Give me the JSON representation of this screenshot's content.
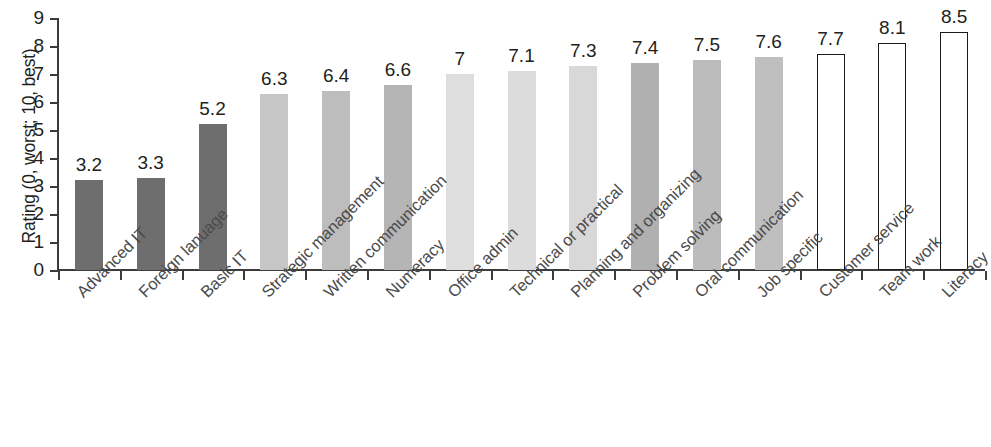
{
  "chart_data": {
    "type": "bar",
    "title": "",
    "subtitle": "",
    "xlabel": "",
    "ylabel": "Rating (0, worst; 10, best)",
    "ylim": [
      0,
      9
    ],
    "ytick_labels": [
      "0",
      "1",
      "2",
      "3",
      "4",
      "5",
      "6",
      "7",
      "8",
      "9"
    ],
    "ytick_values": [
      0,
      1,
      2,
      3,
      4,
      5,
      6,
      7,
      8,
      9
    ],
    "grid": false,
    "legend": "none",
    "categories": [
      "Advanced IT",
      "Foreign lanuage",
      "Basic IT",
      "Strategic management",
      "Written communication",
      "Numeracy",
      "Office admin",
      "Technical or practical",
      "Planning and organizing",
      "Problem solving",
      "Oral communication",
      "Job specific",
      "Customer service",
      "Team work",
      "Literacy"
    ],
    "values": [
      3.2,
      3.3,
      5.2,
      6.3,
      6.4,
      6.6,
      7,
      7.1,
      7.3,
      7.4,
      7.5,
      7.6,
      7.7,
      8.1,
      8.5
    ],
    "value_labels": [
      "3.2",
      "3.3",
      "5.2",
      "6.3",
      "6.4",
      "6.6",
      "7",
      "7.1",
      "7.3",
      "7.4",
      "7.5",
      "7.6",
      "7.7",
      "8.1",
      "8.5"
    ],
    "bar_fills": [
      "#6e6e6e",
      "#6e6e6e",
      "#6e6e6e",
      "#c6c6c6",
      "#bdbdbd",
      "#b5b5b5",
      "#dedede",
      "#dcdcdc",
      "#d8d8d8",
      "#b0b0b0",
      "#bcbcbc",
      "#bfbfbf",
      "#ffffff",
      "#ffffff",
      "#ffffff"
    ],
    "bar_outlined": [
      false,
      false,
      false,
      false,
      false,
      false,
      false,
      false,
      false,
      false,
      false,
      false,
      true,
      true,
      true
    ],
    "axis_color": "#3c3c3c",
    "text_color": "#231f20",
    "label_color": "#4a4a4a",
    "background": "#ffffff"
  }
}
